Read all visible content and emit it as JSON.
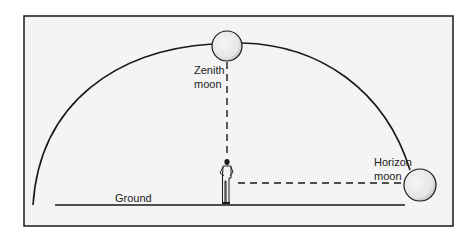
{
  "labels": {
    "zenith_line1": "Zenith",
    "zenith_line2": "moon",
    "horizon_line1": "Horizon",
    "horizon_line2": "moon",
    "ground": "Ground"
  },
  "colors": {
    "background": "#f4f4f4",
    "ink": "#1a1a1a",
    "moon_fill": "#f0f0f0"
  }
}
